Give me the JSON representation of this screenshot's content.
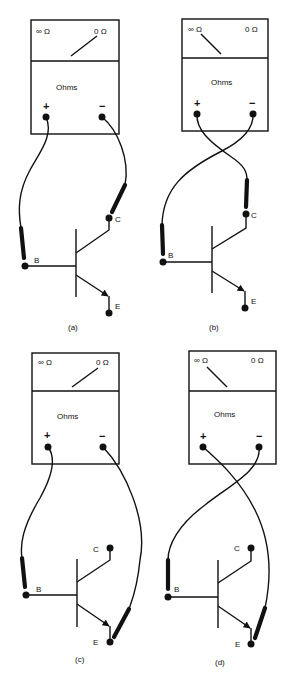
{
  "figure": {
    "panels": [
      {
        "id": "a",
        "caption": "(a)",
        "meter": {
          "scale_left": "∞ Ω",
          "scale_right": "0 Ω",
          "label": "Ohms",
          "pos_terminal": "+",
          "neg_terminal": "−",
          "needle_reading": "0 Ω (low resistance)"
        },
        "transistor": {
          "base": "B",
          "collector": "C",
          "emitter": "E"
        },
        "connections": {
          "positive_lead": "B",
          "negative_lead": "C"
        }
      },
      {
        "id": "b",
        "caption": "(b)",
        "meter": {
          "scale_left": "∞ Ω",
          "scale_right": "0 Ω",
          "label": "Ohms",
          "pos_terminal": "+",
          "neg_terminal": "−",
          "needle_reading": "∞ Ω (high resistance)"
        },
        "transistor": {
          "base": "B",
          "collector": "C",
          "emitter": "E"
        },
        "connections": {
          "positive_lead": "C",
          "negative_lead": "B"
        }
      },
      {
        "id": "c",
        "caption": "(c)",
        "meter": {
          "scale_left": "∞ Ω",
          "scale_right": "0 Ω",
          "label": "Ohms",
          "pos_terminal": "+",
          "neg_terminal": "−",
          "needle_reading": "0 Ω (low resistance)"
        },
        "transistor": {
          "base": "B",
          "collector": "C",
          "emitter": "E"
        },
        "connections": {
          "positive_lead": "B",
          "negative_lead": "E"
        }
      },
      {
        "id": "d",
        "caption": "(d)",
        "meter": {
          "scale_left": "∞ Ω",
          "scale_right": "0 Ω",
          "label": "Ohms",
          "pos_terminal": "+",
          "neg_terminal": "−",
          "needle_reading": "∞ Ω (high resistance)"
        },
        "transistor": {
          "base": "B",
          "collector": "C",
          "emitter": "E"
        },
        "connections": {
          "positive_lead": "E",
          "negative_lead": "B"
        }
      }
    ]
  }
}
